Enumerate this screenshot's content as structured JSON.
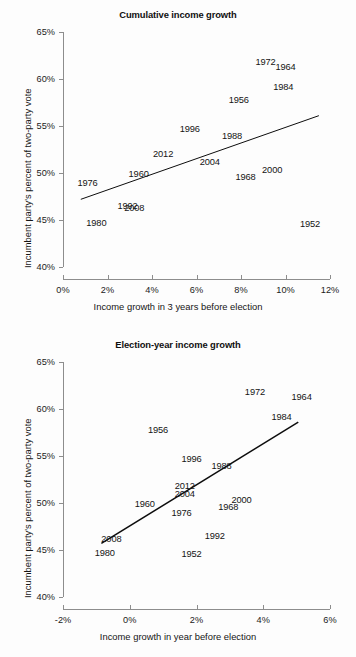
{
  "figure": {
    "smudge_label": "scan-artifact"
  },
  "chart_data": [
    {
      "id": "cumulative-income-growth",
      "type": "scatter",
      "title": "Cumulative income growth",
      "xlabel": "Income growth in 3 years before election",
      "ylabel": "Incumbent party's percent of two-party vote",
      "xlim": [
        0,
        12
      ],
      "ylim": [
        40,
        65
      ],
      "xticks": [
        0,
        2,
        4,
        6,
        8,
        10,
        12
      ],
      "xtick_labels": [
        "0%",
        "2%",
        "4%",
        "6%",
        "8%",
        "10%",
        "12%"
      ],
      "yticks": [
        40,
        45,
        50,
        55,
        60,
        65
      ],
      "ytick_labels": [
        "40%",
        "45%",
        "50%",
        "55%",
        "60%",
        "65%"
      ],
      "grid": false,
      "legend": "none",
      "point_label_field": "year",
      "points": [
        {
          "year": "1952",
          "x": 11.1,
          "y": 44.6
        },
        {
          "year": "1956",
          "x": 7.9,
          "y": 57.8
        },
        {
          "year": "1960",
          "x": 3.4,
          "y": 49.9
        },
        {
          "year": "1964",
          "x": 10.0,
          "y": 61.3
        },
        {
          "year": "1968",
          "x": 8.2,
          "y": 49.6
        },
        {
          "year": "1972",
          "x": 9.1,
          "y": 61.8
        },
        {
          "year": "1976",
          "x": 1.1,
          "y": 48.9
        },
        {
          "year": "1980",
          "x": 1.5,
          "y": 44.7
        },
        {
          "year": "1984",
          "x": 9.9,
          "y": 59.2
        },
        {
          "year": "1988",
          "x": 7.6,
          "y": 53.9
        },
        {
          "year": "1992",
          "x": 2.9,
          "y": 46.5
        },
        {
          "year": "1996",
          "x": 5.7,
          "y": 54.7
        },
        {
          "year": "2000",
          "x": 9.4,
          "y": 50.3
        },
        {
          "year": "2004",
          "x": 6.6,
          "y": 51.2
        },
        {
          "year": "2008",
          "x": 3.2,
          "y": 46.3
        },
        {
          "year": "2012",
          "x": 4.5,
          "y": 52.0
        }
      ],
      "fit_line": {
        "x0": 0.8,
        "y0": 47.2,
        "x1": 11.5,
        "y1": 56.1
      }
    },
    {
      "id": "election-year-income-growth",
      "type": "scatter",
      "title": "Election-year income growth",
      "xlabel": "Income growth in year before election",
      "ylabel": "Incumbent party's percent of two-party vote",
      "xlim": [
        -2,
        6
      ],
      "ylim": [
        40,
        65
      ],
      "xticks": [
        -2,
        0,
        2,
        4,
        6
      ],
      "xtick_labels": [
        "-2%",
        "0%",
        "2%",
        "4%",
        "6%"
      ],
      "yticks": [
        40,
        45,
        50,
        55,
        60,
        65
      ],
      "ytick_labels": [
        "40%",
        "45%",
        "50%",
        "55%",
        "60%",
        "65%"
      ],
      "grid": false,
      "legend": "none",
      "point_label_field": "year",
      "points": [
        {
          "year": "1952",
          "x": 1.85,
          "y": 44.6
        },
        {
          "year": "1956",
          "x": 0.85,
          "y": 57.8
        },
        {
          "year": "1960",
          "x": 0.45,
          "y": 49.9
        },
        {
          "year": "1964",
          "x": 5.15,
          "y": 61.3
        },
        {
          "year": "1968",
          "x": 2.95,
          "y": 49.6
        },
        {
          "year": "1972",
          "x": 3.75,
          "y": 61.8
        },
        {
          "year": "1976",
          "x": 1.55,
          "y": 48.9
        },
        {
          "year": "1980",
          "x": -0.75,
          "y": 44.7
        },
        {
          "year": "1984",
          "x": 4.55,
          "y": 59.2
        },
        {
          "year": "1988",
          "x": 2.75,
          "y": 53.9
        },
        {
          "year": "1992",
          "x": 2.55,
          "y": 46.5
        },
        {
          "year": "1996",
          "x": 1.85,
          "y": 54.7
        },
        {
          "year": "2000",
          "x": 3.35,
          "y": 50.3
        },
        {
          "year": "2004",
          "x": 1.65,
          "y": 51.0
        },
        {
          "year": "2008",
          "x": -0.55,
          "y": 46.2
        },
        {
          "year": "2012",
          "x": 1.65,
          "y": 51.8
        }
      ],
      "fit_line": {
        "x0": -0.85,
        "y0": 45.7,
        "x1": 5.05,
        "y1": 58.6
      }
    }
  ]
}
